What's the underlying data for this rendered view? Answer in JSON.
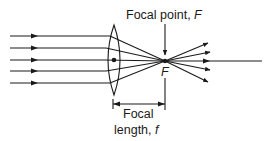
{
  "diagram": {
    "type": "converging-lens-ray-diagram",
    "colors": {
      "ink": "#1a1a1a",
      "background": "#ffffff"
    },
    "labels": {
      "focal_point_text": "Focal point, ",
      "focal_point_symbol": "F",
      "focus_marker": "F",
      "focal_length_line1": "Focal",
      "focal_length_line2_text": "length, ",
      "focal_length_symbol": "f"
    },
    "incoming_rays": [
      36,
      48,
      60,
      71,
      83
    ],
    "outgoing_ray_ends": [
      43,
      52,
      61,
      70,
      82
    ],
    "lens": {
      "center_x": 114,
      "center_y": 60,
      "top_y": 25,
      "bottom_y": 95,
      "half_width": 10
    },
    "focal_point": {
      "x": 165,
      "y": 61
    },
    "axis_end_x": 262
  }
}
